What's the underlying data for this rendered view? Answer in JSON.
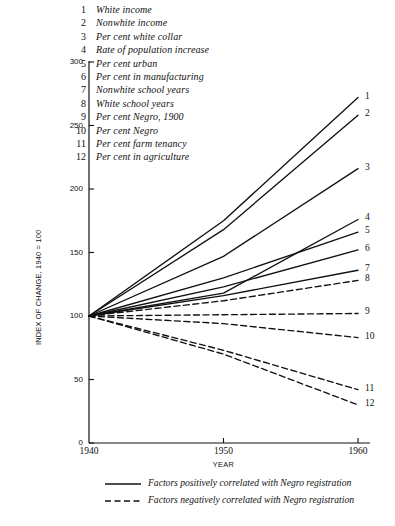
{
  "chart_data": {
    "type": "line",
    "title": "",
    "xlabel": "YEAR",
    "ylabel": "INDEX OF CHANGE, 1940 = 100",
    "x": [
      1940,
      1950,
      1960
    ],
    "xlim": [
      1940,
      1960
    ],
    "ylim": [
      0,
      300
    ],
    "xticks": [
      "1940",
      "1950",
      "1960"
    ],
    "yticks": [
      "0",
      "50",
      "100",
      "150",
      "200",
      "250",
      "300"
    ],
    "grid": false,
    "legend_position": "top-left",
    "series": [
      {
        "num": "1",
        "name": "White income",
        "style": "solid",
        "values": [
          100,
          175,
          272
        ],
        "end_label": "1"
      },
      {
        "num": "2",
        "name": "Nonwhite income",
        "style": "solid",
        "values": [
          100,
          168,
          258
        ],
        "end_label": "2"
      },
      {
        "num": "3",
        "name": "Per cent white collar",
        "style": "solid",
        "values": [
          100,
          147,
          216
        ],
        "end_label": "3"
      },
      {
        "num": "4",
        "name": "Rate of population increase",
        "style": "solid",
        "values": [
          100,
          118,
          176
        ],
        "end_label": "4"
      },
      {
        "num": "5",
        "name": "Per cent urban",
        "style": "solid",
        "values": [
          100,
          130,
          166
        ],
        "end_label": "5"
      },
      {
        "num": "6",
        "name": "Per cent in manufacturing",
        "style": "solid",
        "values": [
          100,
          123,
          152
        ],
        "end_label": "6"
      },
      {
        "num": "7",
        "name": "Nonwhite school years",
        "style": "solid",
        "values": [
          100,
          116,
          136
        ],
        "end_label": "7"
      },
      {
        "num": "8",
        "name": "White school years",
        "style": "dashed",
        "values": [
          100,
          112,
          128
        ],
        "end_label": "8"
      },
      {
        "num": "9",
        "name": "Per cent Negro, 1900",
        "style": "dashed",
        "values": [
          100,
          101,
          102
        ],
        "end_label": "9"
      },
      {
        "num": "10",
        "name": "Per cent Negro",
        "style": "dashed",
        "values": [
          100,
          94,
          83
        ],
        "end_label": "10"
      },
      {
        "num": "11",
        "name": "Per cent farm tenancy",
        "style": "dashed",
        "values": [
          100,
          73,
          42
        ],
        "end_label": "11"
      },
      {
        "num": "12",
        "name": "Per cent in agriculture",
        "style": "dashed",
        "values": [
          100,
          70,
          30
        ],
        "end_label": "12"
      }
    ],
    "footnotes": [
      {
        "style": "solid",
        "text": "Factors positively correlated with Negro registration"
      },
      {
        "style": "dashed",
        "text": "Factors negatively correlated with Negro registration"
      }
    ]
  },
  "colors": {
    "ink": "#111111",
    "background": "#ffffff"
  }
}
